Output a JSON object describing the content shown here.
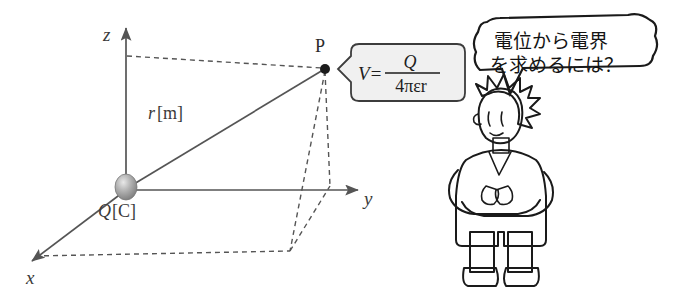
{
  "figure": {
    "axes": {
      "x_label": "x",
      "y_label": "y",
      "z_label": "z"
    },
    "charge": {
      "label": "Q[C]",
      "symbol": "Q",
      "unit_bracket": "[C]"
    },
    "distance": {
      "label": "r[m]",
      "symbol": "r",
      "unit_bracket": "[m]"
    },
    "point": {
      "label": "P"
    },
    "formula": {
      "lhs": "V=",
      "numerator": "Q",
      "denominator": "4πεr",
      "full": "V = Q / (4πεr)"
    },
    "speech": {
      "line1": "電位から電界",
      "line2": "を求めるには？",
      "full": "電位から電界を求めるには？"
    },
    "character": {
      "name": "scientist-character",
      "hair_color": "#7a7a7a",
      "coat_color": "#ffffff",
      "pants_color": "#a8a8a8",
      "shoes_color": "#6e6e6e"
    },
    "colors": {
      "line": "#555555",
      "ink": "#1a1a1a",
      "callout_fill": "#f0f0f0",
      "charge_sphere": "#9a9a9a",
      "background": "#ffffff"
    }
  }
}
